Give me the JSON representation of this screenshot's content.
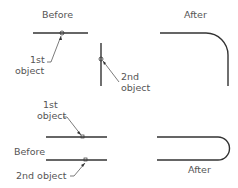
{
  "diagram": {
    "top": {
      "before_label": "Before",
      "after_label": "After",
      "first_object_line1": "1st",
      "first_object_line2": "object",
      "second_object_line1": "2nd",
      "second_object_line2": "object"
    },
    "bottom": {
      "before_label": "Before",
      "after_label": "After",
      "first_object_line1": "1st",
      "first_object_line2": "object",
      "second_object_label": "2nd object"
    },
    "colors": {
      "line": "#333333",
      "text": "#555555",
      "leader": "#444444"
    }
  }
}
